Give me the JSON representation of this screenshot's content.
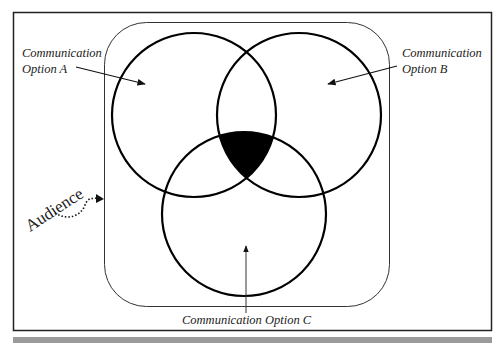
{
  "diagram": {
    "type": "venn",
    "sets": [
      {
        "id": "A",
        "label_line1": "Communication",
        "label_line2": "Option A"
      },
      {
        "id": "B",
        "label_line1": "Communication",
        "label_line2": "Option B"
      },
      {
        "id": "C",
        "label": "Communication Option C"
      }
    ],
    "container_label": "Audience",
    "highlighted_region": "A∩B∩C",
    "colors": {
      "stroke": "#000000",
      "fill_intersection": "#000000",
      "background": "#ffffff",
      "footer_bar": "#9a9a9a"
    }
  }
}
